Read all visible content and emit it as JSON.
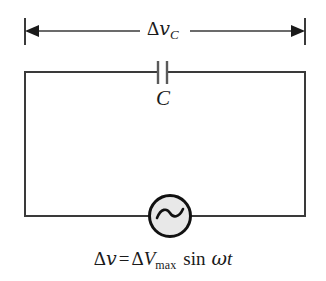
{
  "figure": {
    "kind": "circuit-diagram",
    "background_color": "#ffffff",
    "line_color": "#3a3a3a",
    "ink_color": "#1a1a1a"
  },
  "dimension": {
    "name": "capacitor-voltage-span",
    "label_delta": "Δ",
    "label_variable": "v",
    "label_subscript": "C",
    "label_full": "Δv_C",
    "left_cap_x": 25,
    "right_cap_x": 305,
    "line_y": 31,
    "arrow_direction": "both"
  },
  "circuit": {
    "rect": {
      "left": 25,
      "top": 72,
      "right": 305,
      "bottom": 216
    },
    "stroke_width": 2
  },
  "capacitor": {
    "name": "capacitor",
    "label": "C",
    "plate_left_x": 158,
    "plate_right_x": 167,
    "plate_top_y": 61,
    "plate_bottom_y": 84,
    "gap": 9
  },
  "source": {
    "name": "ac-source",
    "symbol": "~",
    "center_x": 170,
    "center_y": 216,
    "radius": 21,
    "fill_color": "#e8e8e8",
    "stroke_color": "#111111",
    "stroke_width": 3
  },
  "equation": {
    "delta1": "Δ",
    "v": "v",
    "equals": "=",
    "delta2": "Δ",
    "V": "V",
    "subscript": "max",
    "function": "sin",
    "omega": "ω",
    "t": "t",
    "full": "Δv = ΔV_max sin ωt"
  }
}
